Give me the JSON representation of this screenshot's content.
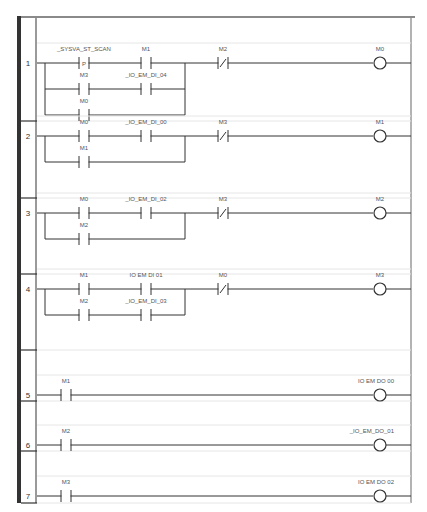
{
  "diagram": {
    "type": "ladder-logic",
    "colors": {
      "wire": "#333333",
      "label": "#555555",
      "gutter": "#333333",
      "frame": "#999999",
      "separator": "#e6e6e6"
    },
    "rungs": [
      {
        "number": "1",
        "branches": [
          {
            "contacts": [
              {
                "label": "_SYSVA_ST_SCAN",
                "type": "P"
              },
              {
                "label": "M1",
                "type": "NO"
              }
            ]
          },
          {
            "contacts": [
              {
                "label": "M3",
                "type": "NO"
              },
              {
                "label": "_IO_EM_DI_04",
                "type": "NO"
              }
            ]
          },
          {
            "contacts": [
              {
                "label": "M0",
                "type": "NO"
              }
            ]
          }
        ],
        "series": [
          {
            "label": "M2",
            "type": "NC"
          }
        ],
        "coil": {
          "label": "M0"
        }
      },
      {
        "number": "2",
        "branches": [
          {
            "contacts": [
              {
                "label": "M0",
                "type": "NO"
              },
              {
                "label": "_IO_EM_DI_00",
                "type": "NO"
              }
            ]
          },
          {
            "contacts": [
              {
                "label": "M1",
                "type": "NO"
              }
            ]
          }
        ],
        "series": [
          {
            "label": "M3",
            "type": "NC"
          }
        ],
        "coil": {
          "label": "M1"
        }
      },
      {
        "number": "3",
        "branches": [
          {
            "contacts": [
              {
                "label": "M0",
                "type": "NO"
              },
              {
                "label": "_IO_EM_DI_02",
                "type": "NO"
              }
            ]
          },
          {
            "contacts": [
              {
                "label": "M2",
                "type": "NO"
              }
            ]
          }
        ],
        "series": [
          {
            "label": "M3",
            "type": "NC"
          }
        ],
        "coil": {
          "label": "M2"
        }
      },
      {
        "number": "4",
        "branches": [
          {
            "contacts": [
              {
                "label": "M1",
                "type": "NO"
              },
              {
                "label": "IO EM DI 01",
                "type": "NO"
              }
            ]
          },
          {
            "contacts": [
              {
                "label": "M2",
                "type": "NO"
              },
              {
                "label": "_IO_EM_DI_03",
                "type": "NO"
              }
            ]
          }
        ],
        "series": [
          {
            "label": "M0",
            "type": "NC"
          }
        ],
        "coil": {
          "label": "M3"
        }
      },
      {
        "number": "5",
        "branches": [
          {
            "contacts": [
              {
                "label": "M1",
                "type": "NO"
              }
            ]
          }
        ],
        "series": [],
        "coil": {
          "label": "IO EM DO 00"
        }
      },
      {
        "number": "6",
        "branches": [
          {
            "contacts": [
              {
                "label": "M2",
                "type": "NO"
              }
            ]
          }
        ],
        "series": [],
        "coil": {
          "label": "_IO_EM_DO_01"
        }
      },
      {
        "number": "7",
        "branches": [
          {
            "contacts": [
              {
                "label": "M3",
                "type": "NO"
              }
            ]
          }
        ],
        "series": [],
        "coil": {
          "label": "IO EM DO 02"
        }
      }
    ]
  }
}
